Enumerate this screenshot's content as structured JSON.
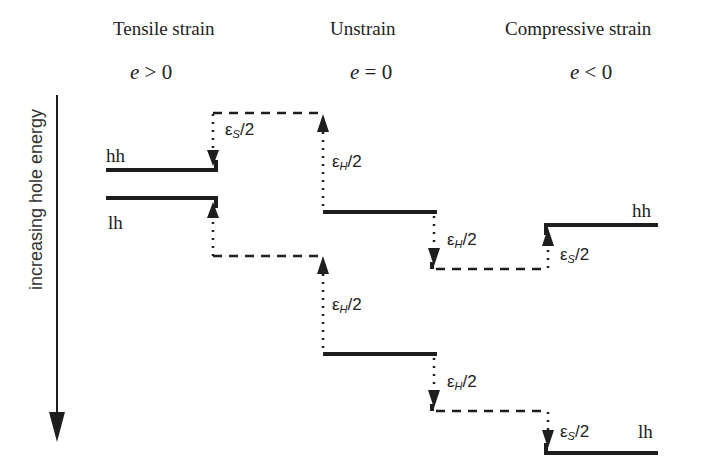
{
  "headers": {
    "tensile": {
      "title": "Tensile strain",
      "condition_var": "e",
      "condition_rel": " > 0"
    },
    "unstrain": {
      "title": "Unstrain",
      "condition_var": "e",
      "condition_rel": " = 0"
    },
    "compressive": {
      "title": "Compressive strain",
      "condition_var": "e",
      "condition_rel": " < 0"
    }
  },
  "axis": {
    "label": "increasing hole energy",
    "direction": "down"
  },
  "bands": {
    "tensile_hh": "hh",
    "tensile_lh": "lh",
    "compressive_hh": "hh",
    "compressive_lh": "lh"
  },
  "shifts": {
    "eps_symbol": "ε",
    "s_sub": "S",
    "h_sub": "H",
    "half": "/2"
  },
  "colors": {
    "line": "#1e1e1e",
    "text": "#222222",
    "background": "#ffffff"
  }
}
